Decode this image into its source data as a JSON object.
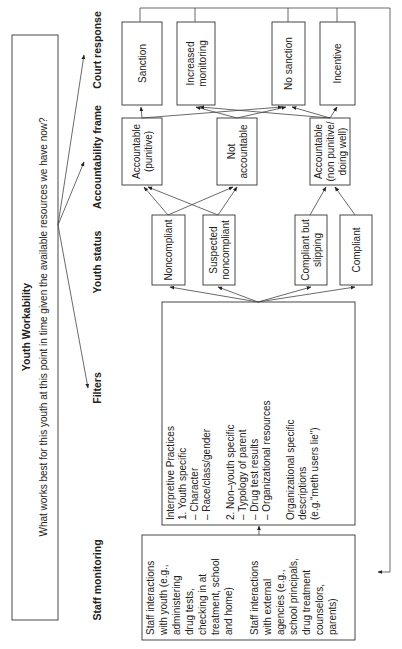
{
  "workability": {
    "title": "Youth Workability",
    "question": "What works best for this youth at this point in time given the available resources we have now?"
  },
  "columns": {
    "court_response": "Court response",
    "accountability_frame": "Accountability frame",
    "youth_status": "Youth status",
    "filters": "Filters",
    "staff_monitoring": "Staff monitoring"
  },
  "court_responses": [
    {
      "lines": [
        "Sanction"
      ]
    },
    {
      "lines": [
        "Increased",
        "monitoring"
      ]
    },
    {
      "lines": [
        "No sanction"
      ]
    },
    {
      "lines": [
        "Incentive"
      ]
    }
  ],
  "accountability": [
    {
      "lines": [
        "Accountable",
        "(punitive)"
      ]
    },
    {
      "lines": [
        "Not",
        "accountable"
      ]
    },
    {
      "lines": [
        "Accountable",
        "(non punitive/",
        "doing well)"
      ]
    }
  ],
  "youth_status": [
    {
      "lines": [
        "Noncompliant"
      ]
    },
    {
      "lines": [
        "Suspected",
        "noncompliant"
      ]
    },
    {
      "lines": [
        "Compliant  but",
        "slipping"
      ]
    },
    {
      "lines": [
        "Compliant"
      ]
    }
  ],
  "filters": {
    "lines": [
      "Interpretive Practices",
      "1. Youth specific",
      "    – Character",
      "    – Race/class/gender",
      "",
      "2. Non–youth specific",
      "    – Typology of parent",
      "    – Drug test results",
      "    – Organizational resources",
      "",
      "Organizational specific",
      "descriptions",
      "(e.g.\"meth users lie\")"
    ]
  },
  "staff_monitoring": {
    "lines": [
      "Staff interactions",
      "with youth (e.g.,",
      "administering",
      "drug tests,",
      "checking in at",
      "treatment, school",
      "and home)",
      "",
      "Staff interactions",
      "with external",
      "agencies (e.g.,",
      "school principals,",
      "drug treatment",
      "counselors,",
      "parents)"
    ]
  }
}
